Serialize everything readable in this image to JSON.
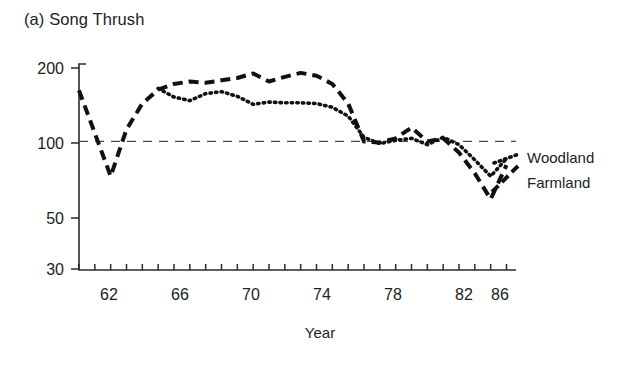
{
  "figure": {
    "panel_label": "(a)",
    "title": "(a) Song Thrush",
    "species": "Song Thrush"
  },
  "legend": {
    "position": "right",
    "items": [
      {
        "label": "Woodland",
        "style": "dotted"
      },
      {
        "label": "Farmland",
        "style": "dashed"
      }
    ],
    "woodland_label": "Woodland",
    "farmland_label": "Farmland"
  },
  "axes": {
    "x_title": "Year",
    "y_tick_labels": [
      "200",
      "100",
      "50",
      "30"
    ],
    "x_tick_labels": [
      "62",
      "66",
      "70",
      "74",
      "78",
      "82",
      "86"
    ]
  },
  "chart_data": {
    "type": "line",
    "title": "(a) Song Thrush",
    "xlabel": "Year",
    "ylabel": "",
    "yscale": "log",
    "ylim": [
      30,
      215
    ],
    "xlim": [
      1961,
      1988.6
    ],
    "grid": false,
    "legend_position": "right",
    "y_ticks": [
      200,
      100,
      50,
      30
    ],
    "x_ticks": [
      1961,
      1962,
      1963,
      1964,
      1965,
      1966,
      1967,
      1968,
      1969,
      1970,
      1971,
      1972,
      1973,
      1974,
      1975,
      1976,
      1977,
      1978,
      1979,
      1980,
      1981,
      1982,
      1983,
      1984,
      1985,
      1986,
      1987,
      1988
    ],
    "x_tick_labels_shown": [
      1962,
      1966,
      1970,
      1974,
      1978,
      1982,
      1986
    ],
    "reference_line": {
      "y": 100,
      "style": "dashed",
      "label": ""
    },
    "x": [
      1961,
      1962,
      1963,
      1964,
      1965,
      1966,
      1967,
      1968,
      1969,
      1970,
      1971,
      1972,
      1973,
      1974,
      1975,
      1976,
      1977,
      1978,
      1979,
      1980,
      1981,
      1982,
      1983,
      1984,
      1985,
      1986,
      1987,
      1988
    ],
    "series": [
      {
        "name": "Farmland",
        "style": "dashed",
        "values": [
          162,
          108,
          72,
          112,
          143,
          163,
          172,
          176,
          174,
          178,
          182,
          190,
          176,
          184,
          191,
          186,
          172,
          143,
          100,
          99,
          103,
          114,
          100,
          103,
          90,
          74,
          58,
          80
        ]
      },
      {
        "name": "Woodland",
        "style": "dotted",
        "values": [
          null,
          null,
          null,
          null,
          null,
          165,
          152,
          147,
          157,
          160,
          153,
          142,
          145,
          144,
          144,
          143,
          138,
          127,
          104,
          98,
          101,
          103,
          97,
          104,
          97,
          84,
          72,
          85
        ]
      }
    ]
  }
}
